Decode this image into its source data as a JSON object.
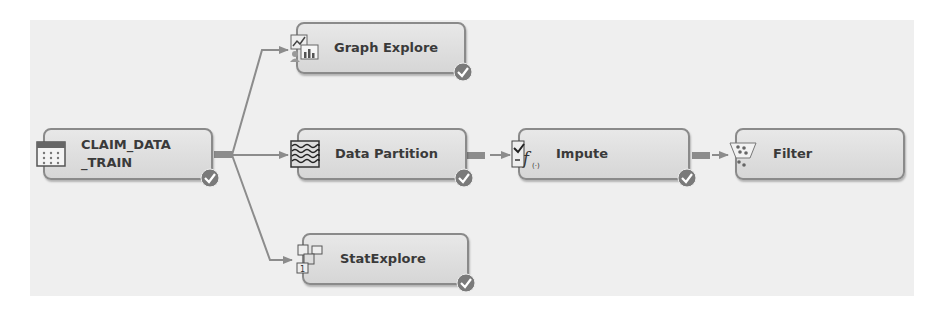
{
  "diagram": {
    "type": "process-flow",
    "nodes": [
      {
        "id": "claim_data_train",
        "label": "CLAIM_DATA\n_TRAIN",
        "icon": "data-source-table-icon",
        "completed": true
      },
      {
        "id": "graph_explore",
        "label": "Graph Explore",
        "icon": "graph-explore-icon",
        "completed": true
      },
      {
        "id": "data_partition",
        "label": "Data Partition",
        "icon": "data-partition-icon",
        "completed": true
      },
      {
        "id": "stat_explore",
        "label": "StatExplore",
        "icon": "stat-explore-icon",
        "completed": true
      },
      {
        "id": "impute",
        "label": "Impute",
        "icon": "impute-icon",
        "completed": true
      },
      {
        "id": "filter",
        "label": "Filter",
        "icon": "filter-icon",
        "completed": false
      }
    ],
    "edges": [
      {
        "from": "claim_data_train",
        "to": "graph_explore"
      },
      {
        "from": "claim_data_train",
        "to": "data_partition"
      },
      {
        "from": "claim_data_train",
        "to": "stat_explore"
      },
      {
        "from": "data_partition",
        "to": "impute"
      },
      {
        "from": "impute",
        "to": "filter"
      }
    ],
    "colors": {
      "node_fill": "#dedede",
      "node_border": "#8a8a8a",
      "edge": "#8c8c8c",
      "check": "#7a7a7a",
      "canvas": "#efefef"
    }
  }
}
